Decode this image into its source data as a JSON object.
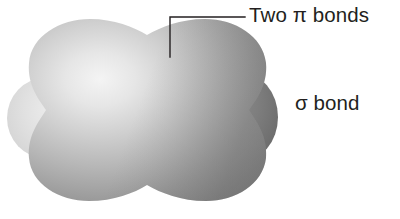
{
  "figure": {
    "name": "molecular-orbital-diagram",
    "background_color": "#ffffff",
    "width": 400,
    "height": 219
  },
  "labels": {
    "pi_bonds": "Two π bonds",
    "sigma_bond": "σ bond"
  },
  "leader_line": {
    "color": "#231f20",
    "width": 1.4,
    "points": "245,17 170,17 170,57"
  },
  "orbital": {
    "main_lobe_name": "sigma-bond-electron-cloud",
    "left_lobe_name": "pi-bond-left-lobe",
    "right_lobe_name": "pi-bond-right-lobe",
    "colors": {
      "highlight": "#f2f2f2",
      "light": "#d8d8d8",
      "mid": "#b3b3b3",
      "dark": "#8a8a8a",
      "darkest": "#6e6e6e",
      "left_lobe_light": "#e4e4e4",
      "left_lobe_mid": "#d2d2d2",
      "right_lobe_dark": "#7b7b7b",
      "right_lobe_darkest": "#636363"
    },
    "highlight_center": {
      "x": 95,
      "y": 80
    }
  }
}
